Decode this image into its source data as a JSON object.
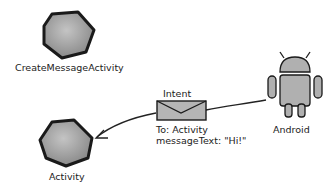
{
  "nodes": {
    "create_activity": {
      "label": "CreateMessageActivity"
    },
    "activity": {
      "label": "Activity"
    },
    "android": {
      "label": "Android"
    }
  },
  "intent": {
    "title": "Intent",
    "line1": "To: Activity",
    "line2": "messageText: \"Hi!\""
  },
  "colors": {
    "shape_fill": "#a9a9a9",
    "outline": "#1a1a1a"
  }
}
